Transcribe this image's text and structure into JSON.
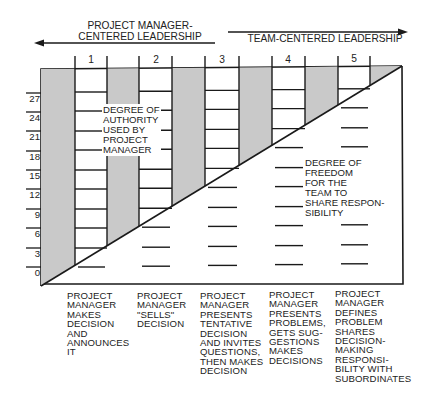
{
  "header": {
    "left_label": "PROJECT MANAGER-\nCENTERED LEADERSHIP",
    "right_label": "TEAM-CENTERED LEADERSHIP"
  },
  "columns": [
    {
      "number": "1",
      "caption": "PROJECT\nMANAGER\nMAKES\nDECISION\nAND\nANNOUNCES\nIT"
    },
    {
      "number": "2",
      "caption": "PROJECT\nMANAGER\n\"SELLS\"\nDECISION"
    },
    {
      "number": "3",
      "caption": "PROJECT\nMANAGER\nPRESENTS\nTENTATIVE\nDECISION\nAND INVITES\nQUESTIONS,\nTHEN MAKES\nDECISION"
    },
    {
      "number": "4",
      "caption": "PROJECT\nMANAGER\nPRESENTS\nPROBLEMS,\nGETS SUG-\nGESTIONS\nMAKES\nDECISIONS"
    },
    {
      "number": "5",
      "caption": "PROJECT\nMANAGER\nDEFINES\nPROBLEM\nSHARES\nDECISION-\nMAKING\nRESPONSI-\nBILITY WITH\nSUBORDINATES"
    }
  ],
  "y_axis": {
    "ticks": [
      "27",
      "24",
      "21",
      "18",
      "15",
      "12",
      "9",
      "6",
      "3",
      "0"
    ]
  },
  "regions": {
    "authority_label": "DEGREE OF\nAUTHORITY\nUSED BY\nPROJECT\nMANAGER",
    "freedom_label": "DEGREE OF\nFREEDOM\nFOR THE\nTEAM TO\nSHARE RESPON-\nSIBILITY"
  },
  "colors": {
    "band_fill": "#c9c9c9",
    "line": "#1a1a1a",
    "background": "#ffffff"
  }
}
